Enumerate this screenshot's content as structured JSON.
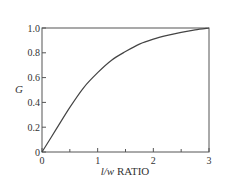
{
  "chart_data": {
    "type": "line",
    "title": "",
    "xlabel_italic": "l/w",
    "xlabel_rest": " RATIO",
    "xlabel": "l/w RATIO",
    "ylabel": "G",
    "xlim": [
      0,
      3
    ],
    "ylim": [
      0,
      1.0
    ],
    "x_ticks": [
      "0",
      "1",
      "2",
      "3"
    ],
    "x_minor_ticks": [
      0.5,
      1.5,
      2.5
    ],
    "y_ticks": [
      "0",
      "0.2",
      "0.4",
      "0.6",
      "0.8",
      "1.0"
    ],
    "grid": false,
    "legend": null,
    "series": [
      {
        "name": "G",
        "x": [
          0,
          0.25,
          0.5,
          0.75,
          1.0,
          1.25,
          1.5,
          1.75,
          2.0,
          2.25,
          2.5,
          2.75,
          3.0
        ],
        "values": [
          0,
          0.18,
          0.36,
          0.52,
          0.64,
          0.74,
          0.81,
          0.87,
          0.91,
          0.94,
          0.965,
          0.985,
          1.0
        ]
      }
    ]
  }
}
